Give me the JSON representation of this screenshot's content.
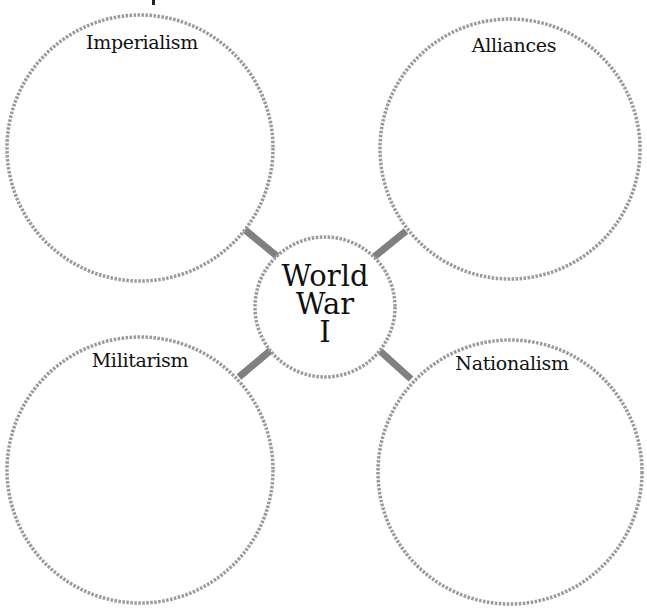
{
  "diagram": {
    "type": "concept-web",
    "center": {
      "lines": [
        "World",
        "War",
        "I"
      ]
    },
    "nodes": [
      {
        "id": "imperialism",
        "label": "Imperialism",
        "position": "top-left"
      },
      {
        "id": "alliances",
        "label": "Alliances",
        "position": "top-right"
      },
      {
        "id": "militarism",
        "label": "Militarism",
        "position": "bottom-left"
      },
      {
        "id": "nationalism",
        "label": "Nationalism",
        "position": "bottom-right"
      }
    ],
    "colors": {
      "circle_stroke": "#9a9a9a",
      "connector": "#7f7f7f",
      "text": "#111111",
      "background": "#ffffff"
    }
  }
}
